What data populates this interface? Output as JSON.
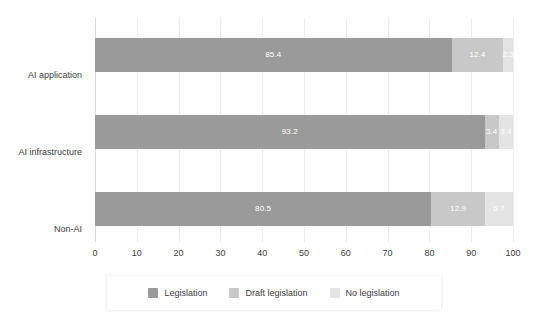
{
  "chart_data": {
    "type": "bar",
    "orientation": "horizontal",
    "stacked": true,
    "title": "",
    "subtitle": "",
    "xlabel": "",
    "ylabel": "",
    "xlim": [
      0,
      100
    ],
    "xticks": [
      "0",
      "10",
      "20",
      "30",
      "40",
      "50",
      "60",
      "70",
      "80",
      "90",
      "100"
    ],
    "grid": true,
    "grid_axis": "x",
    "legend_position": "bottom",
    "categories": [
      "AI application",
      "AI infrastructure",
      "Non-AI"
    ],
    "series": [
      {
        "name": "Legislation",
        "color": "#9a9a9a",
        "values": [
          85.4,
          93.2,
          80.5
        ],
        "labels": [
          "85.4",
          "93.2",
          "80.5"
        ]
      },
      {
        "name": "Draft legislation",
        "color": "#c8c8c8",
        "values": [
          12.4,
          3.4,
          12.9
        ],
        "labels": [
          "12.4",
          "3.4",
          "12.9"
        ]
      },
      {
        "name": "No legislation",
        "color": "#e4e4e4",
        "values": [
          2.3,
          3.4,
          6.7
        ],
        "labels": [
          "2.3",
          "3.4",
          "6.7"
        ]
      }
    ]
  },
  "colors": {
    "legislation": "#9a9a9a",
    "draft_legislation": "#c8c8c8",
    "no_legislation": "#e4e4e4",
    "gridline": "#ececec",
    "text": "#3c3c3c",
    "value_label": "#ffffff",
    "background": "#ffffff"
  },
  "axis": {
    "ticks": [
      {
        "label": "0",
        "value": 0
      },
      {
        "label": "10",
        "value": 10
      },
      {
        "label": "20",
        "value": 20
      },
      {
        "label": "30",
        "value": 30
      },
      {
        "label": "40",
        "value": 40
      },
      {
        "label": "50",
        "value": 50
      },
      {
        "label": "60",
        "value": 60
      },
      {
        "label": "70",
        "value": 70
      },
      {
        "label": "80",
        "value": 80
      },
      {
        "label": "90",
        "value": 90
      },
      {
        "label": "100",
        "value": 100
      }
    ]
  },
  "categories": [
    {
      "label": "AI application"
    },
    {
      "label": "AI infrastructure"
    },
    {
      "label": "Non-AI"
    }
  ],
  "legend": {
    "items": [
      {
        "label": "Legislation",
        "color": "#9a9a9a"
      },
      {
        "label": "Draft legislation",
        "color": "#c8c8c8"
      },
      {
        "label": "No legislation",
        "color": "#e4e4e4"
      }
    ]
  }
}
